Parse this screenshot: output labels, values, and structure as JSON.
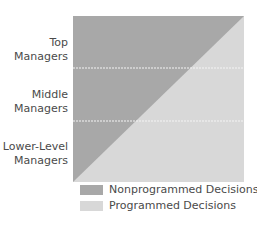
{
  "diagram": {
    "levels": [
      {
        "label_line1": "Top",
        "label_line2": "Managers"
      },
      {
        "label_line1": "Middle",
        "label_line2": "Managers"
      },
      {
        "label_line1": "Lower-Level",
        "label_line2": "Managers"
      }
    ],
    "colors": {
      "nonprogrammed": "#a8a8a8",
      "programmed": "#d8d8d8",
      "divider": "#f2f2f2"
    }
  },
  "legend": {
    "items": [
      {
        "label": "Nonprogrammed Decisions",
        "color": "#a8a8a8"
      },
      {
        "label": "Programmed Decisions",
        "color": "#d8d8d8"
      }
    ]
  }
}
